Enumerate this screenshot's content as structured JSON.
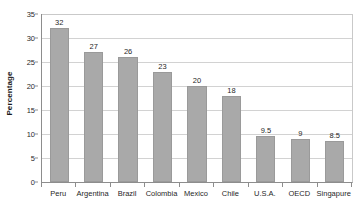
{
  "chart_data": {
    "type": "bar",
    "title": "",
    "subtitle": "",
    "xlabel": "",
    "ylabel": "Percentage",
    "categories": [
      "Peru",
      "Argentina",
      "Brazil",
      "Colombia",
      "Mexico",
      "Chile",
      "U.S.A.",
      "OECD",
      "Singapure"
    ],
    "values": [
      32,
      27,
      26,
      23,
      20,
      18,
      9.5,
      9,
      8.5
    ],
    "value_labels": [
      "32",
      "27",
      "26",
      "23",
      "20",
      "18",
      "9.5",
      "9",
      "8.5"
    ],
    "ylim": [
      0,
      35
    ],
    "ytick_values": [
      0,
      5,
      10,
      15,
      20,
      25,
      30,
      35
    ],
    "ytick_labels": [
      "0",
      "5",
      "10",
      "15",
      "20",
      "25",
      "30",
      "35"
    ],
    "grid": true,
    "grid_axis": "y",
    "legend": false,
    "legend_position": "none",
    "annotations": [],
    "series": [
      {
        "name": "Percentage",
        "values": [
          32,
          27,
          26,
          23,
          20,
          18,
          9.5,
          9,
          8.5
        ]
      }
    ]
  },
  "style": {
    "bar_fill": "#a9a9a9",
    "bar_border": "#9a9a9a",
    "gridline_color": "#d2d2d2",
    "axis_color": "#8d8d8d",
    "text_color": "#1f1f1f",
    "background": "#ffffff"
  }
}
